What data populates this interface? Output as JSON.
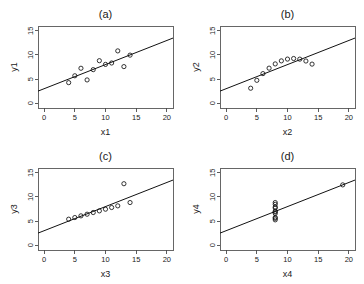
{
  "figure": {
    "background": "#ffffff",
    "layout": "2x2 grid of scatter plots",
    "point_color": "#111111",
    "line_color": "#111111",
    "axis_color": "#4a4a4a"
  },
  "chart_data": [
    {
      "type": "scatter",
      "title": "(a)",
      "xlabel": "x1",
      "ylabel": "y1",
      "xlim": [
        -1,
        21
      ],
      "ylim": [
        -1,
        16
      ],
      "xticks": [
        0,
        5,
        10,
        15,
        20
      ],
      "yticks": [
        0,
        5,
        10,
        15
      ],
      "grid": false,
      "legend": "none",
      "x": [
        10,
        8,
        13,
        9,
        11,
        14,
        6,
        4,
        12,
        7,
        5
      ],
      "y": [
        8.04,
        6.95,
        7.58,
        8.81,
        8.33,
        9.96,
        7.24,
        4.26,
        10.84,
        4.82,
        5.68
      ],
      "fit_line": {
        "intercept": 3.0,
        "slope": 0.5
      }
    },
    {
      "type": "scatter",
      "title": "(b)",
      "xlabel": "x2",
      "ylabel": "y2",
      "xlim": [
        -1,
        21
      ],
      "ylim": [
        -1,
        16
      ],
      "xticks": [
        0,
        5,
        10,
        15,
        20
      ],
      "yticks": [
        0,
        5,
        10,
        15
      ],
      "grid": false,
      "legend": "none",
      "x": [
        10,
        8,
        13,
        9,
        11,
        14,
        6,
        4,
        12,
        7,
        5
      ],
      "y": [
        9.14,
        8.14,
        8.74,
        8.77,
        9.26,
        8.1,
        6.13,
        3.1,
        9.13,
        7.26,
        4.74
      ],
      "fit_line": {
        "intercept": 3.0,
        "slope": 0.5
      }
    },
    {
      "type": "scatter",
      "title": "(c)",
      "xlabel": "x3",
      "ylabel": "y3",
      "xlim": [
        -1,
        21
      ],
      "ylim": [
        -1,
        16
      ],
      "xticks": [
        0,
        5,
        10,
        15,
        20
      ],
      "yticks": [
        0,
        5,
        10,
        15
      ],
      "grid": false,
      "legend": "none",
      "x": [
        10,
        8,
        13,
        9,
        11,
        14,
        6,
        4,
        12,
        7,
        5
      ],
      "y": [
        7.46,
        6.77,
        12.74,
        7.11,
        7.81,
        8.84,
        6.08,
        5.39,
        8.15,
        6.42,
        5.73
      ],
      "fit_line": {
        "intercept": 3.0,
        "slope": 0.5
      }
    },
    {
      "type": "scatter",
      "title": "(d)",
      "xlabel": "x4",
      "ylabel": "y4",
      "xlim": [
        -1,
        21
      ],
      "ylim": [
        -1,
        16
      ],
      "xticks": [
        0,
        5,
        10,
        15,
        20
      ],
      "yticks": [
        0,
        5,
        10,
        15
      ],
      "grid": false,
      "legend": "none",
      "x": [
        8,
        8,
        8,
        8,
        8,
        8,
        8,
        19,
        8,
        8,
        8
      ],
      "y": [
        6.58,
        5.76,
        7.71,
        8.84,
        8.47,
        7.04,
        5.25,
        12.5,
        5.56,
        7.91,
        6.89
      ],
      "fit_line": {
        "intercept": 3.0,
        "slope": 0.5
      }
    }
  ]
}
